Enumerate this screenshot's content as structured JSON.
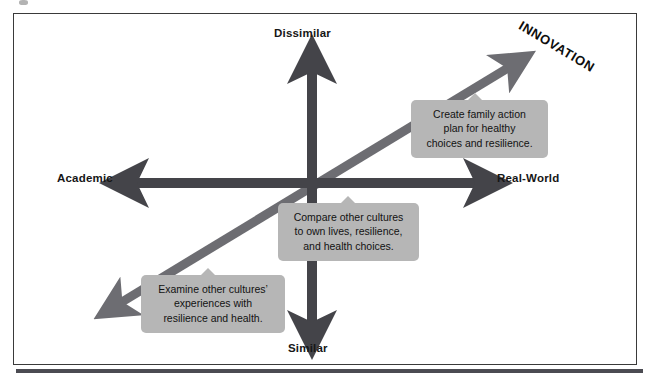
{
  "diagram": {
    "background_color": "#ffffff",
    "frame_color": "#3a3a3a",
    "axis_arrow_color": "#444449",
    "diagonal_arrow_color": "#6d6d72",
    "callout_fill": "#b6b6b6",
    "text_color": "#121212"
  },
  "axes": {
    "vertical": {
      "top_label": "Dissimilar",
      "bottom_label": "Similar",
      "name": "similarity-axis"
    },
    "horizontal": {
      "left_label": "Academic",
      "right_label": "Real-World",
      "name": "context-axis"
    },
    "diagonal": {
      "label": "INNOVATION",
      "name": "innovation-axis",
      "direction": "bottom-left to top-right"
    }
  },
  "callouts": [
    {
      "id": "create-family-action-plan",
      "lines": [
        "Create family action",
        "plan for healthy",
        "choices and resilience."
      ],
      "text": "Create family action plan for healthy choices and resilience.",
      "quadrant": "dissimilar / real-world"
    },
    {
      "id": "compare-other-cultures",
      "lines": [
        "Compare other cultures",
        "to own lives, resilience,",
        "and health choices."
      ],
      "text": "Compare other cultures to own lives, resilience, and health choices.",
      "quadrant": "center"
    },
    {
      "id": "examine-other-cultures",
      "lines": [
        "Examine other cultures’",
        "experiences with",
        "resilience and health."
      ],
      "text": "Examine other cultures’ experiences with resilience and health.",
      "quadrant": "similar / academic"
    }
  ]
}
